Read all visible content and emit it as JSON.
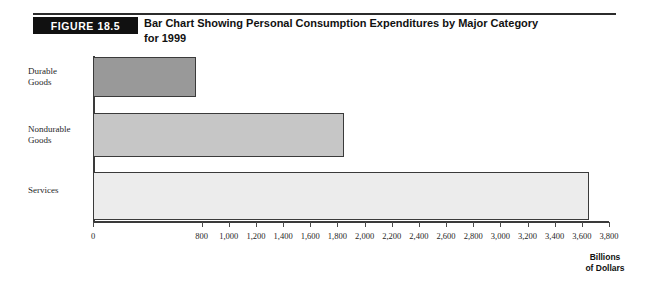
{
  "figure": {
    "tag": "FIGURE 18.5",
    "title_line1": "Bar Chart Showing Personal Consumption Expenditures by Major Category",
    "title_line2": "for 1999"
  },
  "axis_caption": {
    "line1": "Billions",
    "line2": "of Dollars"
  },
  "colors": {
    "bar_durable": "#999999",
    "bar_nondurable": "#c6c6c6",
    "bar_services": "#ececec",
    "bar_border": "#3a3a3a",
    "tag_background": "#111111",
    "tag_text": "#ffffff",
    "axis": "#3a3a3a"
  },
  "chart_data": {
    "type": "bar",
    "orientation": "horizontal",
    "title": "Bar Chart Showing Personal Consumption Expenditures by Major Category for 1999",
    "xlabel": "Billions of Dollars",
    "ylabel": "",
    "xlim": [
      0,
      3800
    ],
    "grid": false,
    "legend": "none",
    "categories": [
      "Durable Goods",
      "Nondurable Goods",
      "Services"
    ],
    "values": [
      760,
      1845,
      3655
    ],
    "bar_colors": [
      "#999999",
      "#c6c6c6",
      "#ececec"
    ],
    "xticks": [
      0,
      200,
      400,
      600,
      800,
      1000,
      1200,
      1400,
      1600,
      1800,
      2000,
      2200,
      2400,
      2600,
      2800,
      3000,
      3200,
      3400,
      3600,
      3800
    ],
    "xtick_labels": [
      "0",
      "",
      "",
      "",
      "800",
      "1,000",
      "1,200",
      "1,400",
      "1,600",
      "1,800",
      "2,000",
      "2,200",
      "2,400",
      "2,600",
      "2,800",
      "3,000",
      "3,200",
      "3,400",
      "3,600",
      "3,800"
    ]
  }
}
